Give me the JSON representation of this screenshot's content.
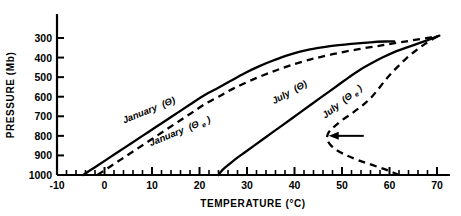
{
  "chart_data": {
    "type": "line",
    "title": "",
    "xlabel": "TEMPERATURE  (°C)",
    "ylabel": "PRESSURE  (Mb)",
    "xlim": [
      -10,
      70
    ],
    "ylim": [
      1000,
      270
    ],
    "y_inverted": true,
    "grid": false,
    "legend": "inline-curve-labels",
    "xticks": [
      -10,
      0,
      10,
      20,
      30,
      40,
      50,
      60,
      70
    ],
    "xticklabels": [
      "-10",
      "0",
      "10",
      "20",
      "30",
      "40",
      "50",
      "60",
      "70"
    ],
    "xminor_step": 2,
    "yticks": [
      300,
      400,
      500,
      600,
      700,
      800,
      900,
      1000
    ],
    "yticklabels": [
      "300",
      "400",
      "500",
      "600",
      "700",
      "800",
      "900",
      "1000"
    ],
    "series": [
      {
        "name": "January (Θ)",
        "label": "January",
        "symbol": "Θ",
        "style": "solid",
        "color": "#000000",
        "points": [
          [
            -4.5,
            1000
          ],
          [
            -2.0,
            960
          ],
          [
            0.5,
            920
          ],
          [
            3.0,
            880
          ],
          [
            5.5,
            840
          ],
          [
            8.0,
            800
          ],
          [
            10.5,
            760
          ],
          [
            13.0,
            720
          ],
          [
            15.5,
            680
          ],
          [
            18.0,
            640
          ],
          [
            20.5,
            600
          ],
          [
            23.5,
            560
          ],
          [
            26.5,
            520
          ],
          [
            29.5,
            480
          ],
          [
            32.5,
            445
          ],
          [
            35.5,
            415
          ],
          [
            39.0,
            385
          ],
          [
            43.0,
            360
          ],
          [
            47.5,
            342
          ],
          [
            52.0,
            330
          ],
          [
            56.0,
            322
          ],
          [
            59.0,
            318
          ],
          [
            61.0,
            317
          ]
        ]
      },
      {
        "name": "January (Θe)",
        "label": "January",
        "symbol": "Θₑ",
        "style": "dashed",
        "color": "#000000",
        "points": [
          [
            -1.5,
            1000
          ],
          [
            1.0,
            960
          ],
          [
            3.5,
            920
          ],
          [
            6.0,
            880
          ],
          [
            8.5,
            840
          ],
          [
            11.0,
            800
          ],
          [
            13.5,
            760
          ],
          [
            16.0,
            720
          ],
          [
            18.5,
            680
          ],
          [
            21.0,
            640
          ],
          [
            24.0,
            600
          ],
          [
            27.0,
            560
          ],
          [
            30.5,
            520
          ],
          [
            34.5,
            480
          ],
          [
            38.5,
            445
          ],
          [
            43.0,
            412
          ],
          [
            48.0,
            383
          ],
          [
            53.5,
            357
          ],
          [
            59.0,
            335
          ],
          [
            64.0,
            315
          ],
          [
            68.0,
            300
          ],
          [
            70.0,
            290
          ]
        ]
      },
      {
        "name": "July (Θ)",
        "label": "July",
        "symbol": "Θ",
        "style": "solid",
        "color": "#000000",
        "points": [
          [
            24.0,
            1000
          ],
          [
            24.8,
            975
          ],
          [
            26.0,
            950
          ],
          [
            27.5,
            920
          ],
          [
            29.5,
            885
          ],
          [
            31.5,
            850
          ],
          [
            33.5,
            815
          ],
          [
            35.5,
            780
          ],
          [
            37.5,
            745
          ],
          [
            39.5,
            710
          ],
          [
            41.5,
            675
          ],
          [
            43.5,
            640
          ],
          [
            45.5,
            605
          ],
          [
            47.5,
            570
          ],
          [
            49.5,
            535
          ],
          [
            51.5,
            500
          ],
          [
            53.5,
            467
          ],
          [
            56.0,
            432
          ],
          [
            58.5,
            400
          ],
          [
            61.0,
            372
          ],
          [
            64.0,
            345
          ],
          [
            67.0,
            320
          ],
          [
            69.5,
            297
          ],
          [
            70.5,
            288
          ]
        ]
      },
      {
        "name": "July (Θe)",
        "label": "July",
        "symbol": "Θₑ",
        "style": "dashed",
        "color": "#000000",
        "points": [
          [
            62.0,
            1000
          ],
          [
            59.5,
            975
          ],
          [
            56.5,
            950
          ],
          [
            53.5,
            925
          ],
          [
            51.0,
            900
          ],
          [
            49.0,
            875
          ],
          [
            47.7,
            850
          ],
          [
            47.0,
            825
          ],
          [
            46.9,
            800
          ],
          [
            47.4,
            775
          ],
          [
            48.5,
            750
          ],
          [
            50.0,
            720
          ],
          [
            51.8,
            690
          ],
          [
            53.5,
            660
          ],
          [
            55.0,
            630
          ],
          [
            56.3,
            600
          ],
          [
            57.5,
            565
          ],
          [
            58.8,
            525
          ],
          [
            60.2,
            485
          ],
          [
            61.8,
            445
          ],
          [
            63.5,
            405
          ],
          [
            65.5,
            365
          ],
          [
            67.5,
            330
          ],
          [
            69.5,
            300
          ],
          [
            70.5,
            288
          ]
        ]
      }
    ],
    "annotations": [
      {
        "name": "nose-arrow",
        "type": "arrow",
        "points_to": [
          47.0,
          800
        ],
        "direction": "left",
        "text": ""
      }
    ]
  },
  "labels": {
    "january_theta": "January",
    "january_theta_sym": "(Θ)",
    "january_thetae": "January",
    "january_thetae_sym_open": "(Θ",
    "january_thetae_sym_sub": "e",
    "january_thetae_sym_close": ")",
    "july_theta": "July",
    "july_theta_sym": "(Θ)",
    "july_thetae": "July",
    "july_thetae_sym_open": "(Θ",
    "july_thetae_sym_sub": "e",
    "july_thetae_sym_close": ")"
  },
  "axes": {
    "x_title": "TEMPERATURE  (°C)",
    "y_title": "PRESSURE  (Mb)"
  },
  "xticklabels": [
    "-10",
    "0",
    "10",
    "20",
    "30",
    "40",
    "50",
    "60",
    "70"
  ],
  "yticklabels": [
    "300",
    "400",
    "500",
    "600",
    "700",
    "800",
    "900",
    "1000"
  ]
}
